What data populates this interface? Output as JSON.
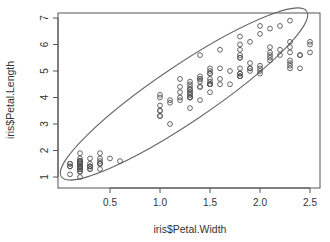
{
  "chart_data": {
    "type": "scatter",
    "title": "",
    "xlabel": "iris$Petal.Width",
    "ylabel": "iris$Petal.Length",
    "xlim": [
      0.1,
      2.5
    ],
    "ylim": [
      1,
      6.9
    ],
    "x_ticks": [
      0.5,
      1.0,
      1.5,
      2.0,
      2.5
    ],
    "x_tick_labels": [
      "0.5",
      "1.0",
      "1.5",
      "2.0",
      "2.5"
    ],
    "y_ticks": [
      1,
      2,
      3,
      4,
      5,
      6,
      7
    ],
    "y_tick_labels": [
      "1",
      "2",
      "3",
      "4",
      "5",
      "6",
      "7"
    ],
    "grid": false,
    "legend": null,
    "marker": "open-circle",
    "annotations": [
      "confidence ellipse around all points"
    ],
    "ellipse": {
      "center": [
        1.2,
        3.76
      ],
      "description": "tilted data ellipse enclosing most points"
    },
    "series": [
      {
        "name": "iris",
        "points": [
          [
            0.2,
            1.4
          ],
          [
            0.2,
            1.4
          ],
          [
            0.2,
            1.3
          ],
          [
            0.2,
            1.5
          ],
          [
            0.2,
            1.4
          ],
          [
            0.4,
            1.7
          ],
          [
            0.3,
            1.4
          ],
          [
            0.2,
            1.5
          ],
          [
            0.2,
            1.4
          ],
          [
            0.1,
            1.5
          ],
          [
            0.2,
            1.5
          ],
          [
            0.2,
            1.6
          ],
          [
            0.1,
            1.4
          ],
          [
            0.1,
            1.1
          ],
          [
            0.2,
            1.2
          ],
          [
            0.4,
            1.5
          ],
          [
            0.4,
            1.3
          ],
          [
            0.3,
            1.4
          ],
          [
            0.3,
            1.7
          ],
          [
            0.3,
            1.5
          ],
          [
            0.2,
            1.7
          ],
          [
            0.4,
            1.5
          ],
          [
            0.2,
            1.0
          ],
          [
            0.5,
            1.7
          ],
          [
            0.2,
            1.9
          ],
          [
            0.2,
            1.6
          ],
          [
            0.4,
            1.6
          ],
          [
            0.2,
            1.5
          ],
          [
            0.2,
            1.4
          ],
          [
            0.2,
            1.6
          ],
          [
            0.2,
            1.6
          ],
          [
            0.4,
            1.5
          ],
          [
            0.1,
            1.5
          ],
          [
            0.2,
            1.4
          ],
          [
            0.2,
            1.5
          ],
          [
            0.2,
            1.2
          ],
          [
            0.2,
            1.3
          ],
          [
            0.1,
            1.4
          ],
          [
            0.2,
            1.3
          ],
          [
            0.2,
            1.5
          ],
          [
            0.3,
            1.3
          ],
          [
            0.3,
            1.3
          ],
          [
            0.2,
            1.3
          ],
          [
            0.6,
            1.6
          ],
          [
            0.4,
            1.9
          ],
          [
            0.3,
            1.4
          ],
          [
            0.2,
            1.6
          ],
          [
            0.2,
            1.4
          ],
          [
            0.2,
            1.5
          ],
          [
            0.2,
            1.4
          ],
          [
            1.4,
            4.7
          ],
          [
            1.5,
            4.5
          ],
          [
            1.5,
            4.9
          ],
          [
            1.3,
            4.0
          ],
          [
            1.5,
            4.6
          ],
          [
            1.3,
            4.5
          ],
          [
            1.6,
            4.7
          ],
          [
            1.0,
            3.3
          ],
          [
            1.3,
            4.6
          ],
          [
            1.4,
            3.9
          ],
          [
            1.0,
            3.5
          ],
          [
            1.5,
            4.2
          ],
          [
            1.0,
            4.0
          ],
          [
            1.4,
            4.7
          ],
          [
            1.3,
            3.6
          ],
          [
            1.4,
            4.4
          ],
          [
            1.5,
            4.5
          ],
          [
            1.0,
            4.1
          ],
          [
            1.5,
            4.5
          ],
          [
            1.1,
            3.9
          ],
          [
            1.8,
            4.8
          ],
          [
            1.3,
            4.0
          ],
          [
            1.5,
            4.9
          ],
          [
            1.2,
            4.7
          ],
          [
            1.3,
            4.3
          ],
          [
            1.4,
            4.4
          ],
          [
            1.4,
            4.8
          ],
          [
            1.7,
            5.0
          ],
          [
            1.5,
            4.5
          ],
          [
            1.0,
            3.5
          ],
          [
            1.1,
            3.8
          ],
          [
            1.0,
            3.7
          ],
          [
            1.2,
            3.9
          ],
          [
            1.6,
            5.1
          ],
          [
            1.5,
            4.5
          ],
          [
            1.6,
            4.5
          ],
          [
            1.5,
            4.7
          ],
          [
            1.3,
            4.4
          ],
          [
            1.3,
            4.1
          ],
          [
            1.3,
            4.0
          ],
          [
            1.2,
            4.4
          ],
          [
            1.4,
            4.6
          ],
          [
            1.2,
            4.0
          ],
          [
            1.0,
            3.3
          ],
          [
            1.3,
            4.2
          ],
          [
            1.2,
            4.2
          ],
          [
            1.3,
            4.2
          ],
          [
            1.3,
            4.3
          ],
          [
            1.1,
            3.0
          ],
          [
            1.3,
            4.1
          ],
          [
            2.5,
            6.0
          ],
          [
            1.9,
            5.1
          ],
          [
            2.1,
            5.9
          ],
          [
            1.8,
            5.6
          ],
          [
            2.2,
            5.8
          ],
          [
            2.1,
            6.6
          ],
          [
            1.7,
            4.5
          ],
          [
            1.8,
            6.3
          ],
          [
            1.8,
            5.8
          ],
          [
            2.5,
            6.1
          ],
          [
            2.0,
            5.1
          ],
          [
            1.9,
            5.3
          ],
          [
            2.1,
            5.5
          ],
          [
            2.0,
            5.0
          ],
          [
            2.4,
            5.1
          ],
          [
            2.3,
            5.3
          ],
          [
            1.8,
            5.5
          ],
          [
            2.2,
            6.7
          ],
          [
            2.3,
            6.9
          ],
          [
            1.5,
            5.0
          ],
          [
            2.3,
            5.7
          ],
          [
            2.0,
            4.9
          ],
          [
            2.0,
            6.7
          ],
          [
            1.8,
            4.9
          ],
          [
            2.1,
            5.7
          ],
          [
            1.8,
            6.0
          ],
          [
            1.8,
            4.8
          ],
          [
            1.8,
            4.9
          ],
          [
            2.1,
            5.6
          ],
          [
            1.6,
            5.8
          ],
          [
            1.9,
            6.1
          ],
          [
            2.0,
            6.4
          ],
          [
            2.2,
            5.6
          ],
          [
            1.5,
            5.1
          ],
          [
            1.4,
            5.6
          ],
          [
            2.3,
            6.1
          ],
          [
            2.4,
            5.6
          ],
          [
            1.8,
            5.5
          ],
          [
            1.8,
            4.8
          ],
          [
            2.1,
            5.4
          ],
          [
            2.4,
            5.6
          ],
          [
            2.3,
            5.1
          ],
          [
            1.9,
            5.1
          ],
          [
            2.3,
            5.9
          ],
          [
            2.5,
            5.7
          ],
          [
            2.3,
            5.2
          ],
          [
            1.9,
            5.0
          ],
          [
            2.0,
            5.2
          ],
          [
            2.3,
            5.4
          ],
          [
            1.8,
            5.1
          ]
        ]
      }
    ]
  },
  "colors": {
    "axis": "#555555",
    "points": "#555555",
    "ellipse": "#666666",
    "text": "#333333",
    "background": "#ffffff"
  }
}
